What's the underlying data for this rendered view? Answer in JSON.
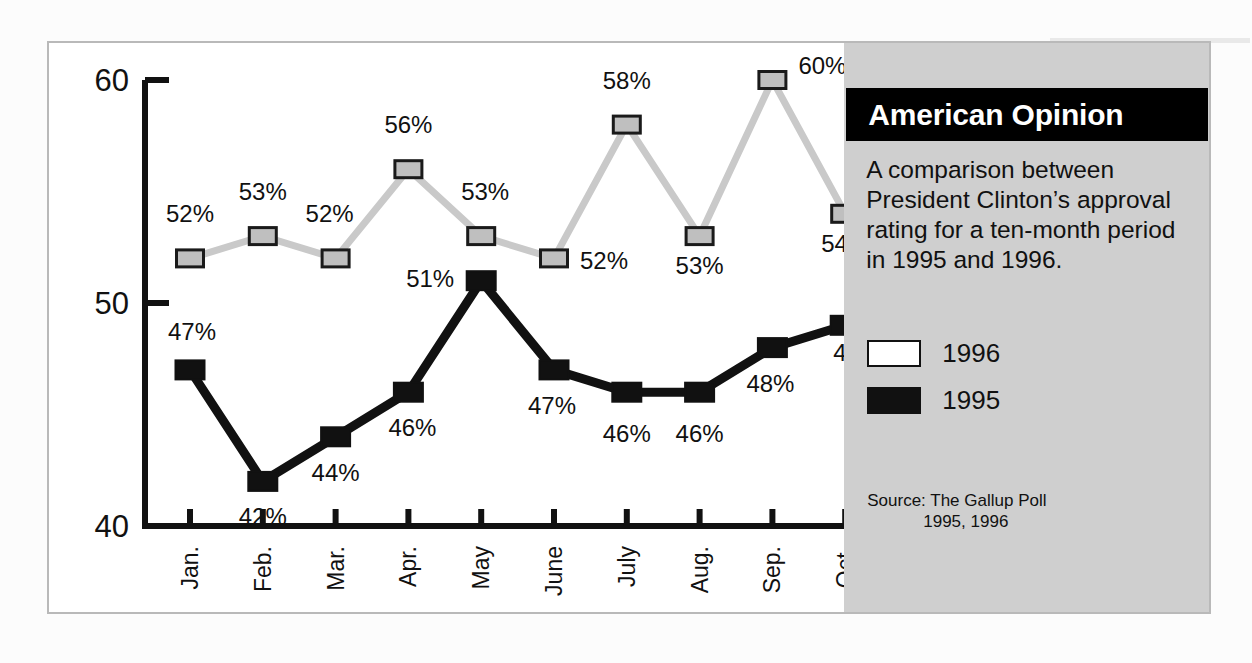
{
  "info_panel": {
    "title": "American Opinion",
    "caption": "A comparison between President Clinton’s approval rating for a ten-month period in 1995 and 1996.",
    "legend": [
      {
        "label": "1996",
        "swatch": "white-square",
        "color": "#ffffff"
      },
      {
        "label": "1995",
        "swatch": "black-square",
        "color": "#111111"
      }
    ],
    "source_line1": "Source:  The Gallup Poll",
    "source_line2": "1995, 1996"
  },
  "chart_data": {
    "type": "line",
    "title": "American Opinion",
    "xlabel": "",
    "ylabel": "",
    "ylim": [
      40,
      60
    ],
    "yticks": [
      40,
      50,
      60
    ],
    "ytick_labels": [
      "40",
      "50",
      "60"
    ],
    "grid": false,
    "legend_position": "right-panel",
    "categories": [
      "Jan.",
      "Feb.",
      "Mar.",
      "Apr.",
      "May",
      "June",
      "July",
      "Aug.",
      "Sep.",
      "Oct."
    ],
    "series": [
      {
        "name": "1996",
        "color": "#c9c9c9",
        "marker": "light-gray-square",
        "values": [
          52,
          53,
          52,
          56,
          53,
          52,
          58,
          53,
          60,
          54
        ],
        "labels": [
          "52%",
          "53%",
          "52%",
          "56%",
          "53%",
          "52%",
          "58%",
          "53%",
          "60%",
          "54%"
        ]
      },
      {
        "name": "1995",
        "color": "#111111",
        "marker": "black-square",
        "values": [
          47,
          42,
          44,
          46,
          51,
          47,
          46,
          46,
          48,
          49
        ],
        "labels": [
          "47%",
          "42%",
          "44%",
          "46%",
          "51%",
          "47%",
          "46%",
          "46%",
          "48%",
          "49%"
        ]
      }
    ]
  }
}
